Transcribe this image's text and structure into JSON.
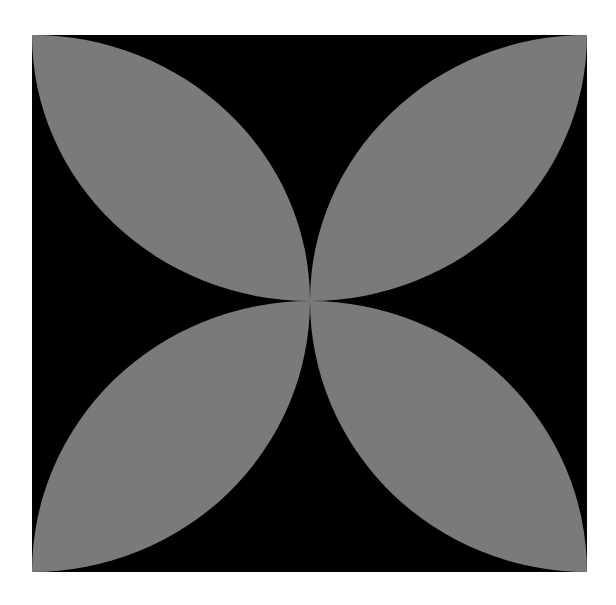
{
  "figure": {
    "caption": "",
    "background_color": "#000000",
    "petal_color": "#7a7a7a",
    "page_color": "#ffffff",
    "square": {
      "left": 32,
      "top": 35,
      "right": 587,
      "bottom": 572
    },
    "center": {
      "x": 310,
      "y": 301
    },
    "petals": [
      {
        "name": "top-left-petal"
      },
      {
        "name": "top-right-petal"
      },
      {
        "name": "bottom-left-petal"
      },
      {
        "name": "bottom-right-petal"
      }
    ]
  }
}
